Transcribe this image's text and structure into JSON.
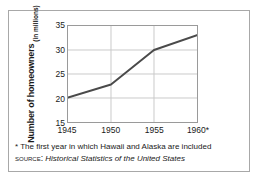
{
  "figure": {
    "y_axis_title_main": "Number of homeowners",
    "y_axis_title_sub": "(in millions)",
    "footnote": "* The first year in which Hawaii and Alaska are included",
    "source_label": "Source:",
    "source_title": "Historical Statistics of the United States"
  },
  "colors": {
    "line": "#4a4a4a",
    "grid": "#c9c9c9",
    "axis": "#9a9a9a",
    "border": "#a8a8a8",
    "text": "#1a1a1a"
  },
  "chart_data": {
    "type": "line",
    "title": "",
    "xlabel": "",
    "ylabel": "Number of homeowners (in millions)",
    "categories": [
      "1945",
      "1950",
      "1955",
      "1960*"
    ],
    "x": [
      1945,
      1950,
      1955,
      1960
    ],
    "values": [
      20.1,
      22.8,
      30.0,
      33.1
    ],
    "series": [
      {
        "name": "Number of homeowners",
        "values": [
          20.1,
          22.8,
          30.0,
          33.1
        ]
      }
    ],
    "xlim": [
      1945,
      1960
    ],
    "ylim": [
      15,
      35
    ],
    "ytick_labels": [
      "35",
      "30",
      "25",
      "20",
      "15"
    ],
    "ytick_values": [
      35,
      30,
      25,
      20,
      15
    ],
    "xtick_labels": [
      "1945",
      "1950",
      "1955",
      "1960*"
    ],
    "grid": true,
    "legend": "none",
    "annotations": [
      "* The first year in which Hawaii and Alaska are included"
    ]
  }
}
